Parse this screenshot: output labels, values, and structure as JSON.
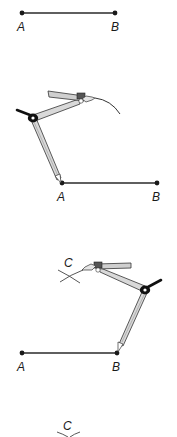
{
  "figure": {
    "colors": {
      "ink": "#1a1a1a",
      "line": "#2a2a2a",
      "compass_body": "#d9d9d9",
      "compass_outline": "#333333",
      "hinge": "#111111",
      "background": "#ffffff"
    }
  },
  "steps": [
    {
      "id": "step-1",
      "labels": {
        "a": "A",
        "b": "B"
      }
    },
    {
      "id": "step-2",
      "labels": {
        "a": "A",
        "b": "B"
      },
      "tool": "compass",
      "center": "A"
    },
    {
      "id": "step-3",
      "labels": {
        "a": "A",
        "b": "B",
        "c": "C"
      },
      "tool": "compass",
      "center": "B"
    },
    {
      "id": "step-4",
      "labels": {
        "c": "C"
      }
    }
  ]
}
